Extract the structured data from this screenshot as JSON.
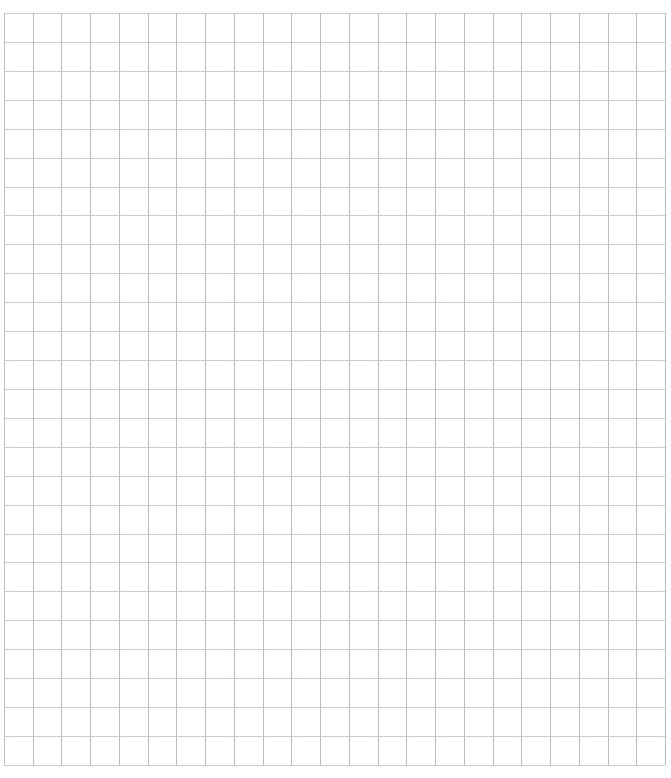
{
  "page": {
    "background_color": "#ffffff",
    "width": 671,
    "height": 778
  },
  "grid": {
    "name": "square-grid-sheet",
    "description": "Blank square graph-paper grid",
    "origin_x": 4,
    "origin_y": 13,
    "columns": 23,
    "rows": 26,
    "cell_width": 28.74,
    "cell_height": 28.92,
    "total_width": 661,
    "total_height": 752,
    "vertical_line_color": "#b9bdc1",
    "horizontal_line_color": "#c8cbcf",
    "line_width": 1,
    "major_lines": false,
    "cell_fill": "#ffffff"
  },
  "margins": {
    "left": 4,
    "top": 13,
    "right": 6,
    "bottom": 13
  }
}
